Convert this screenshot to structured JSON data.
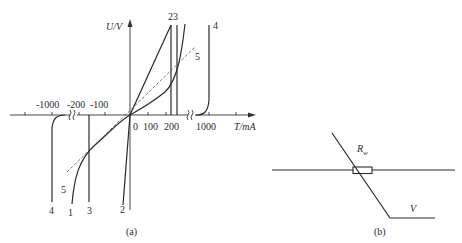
{
  "figure_a": {
    "caption": "(a)",
    "y_axis_label": "U/V",
    "x_axis_label": "T/mA",
    "origin_label": "0",
    "negative_ticks": [
      "-1000",
      "-200",
      "-100"
    ],
    "positive_ticks": [
      "100",
      "200",
      "1000"
    ],
    "curve_labels_top": {
      "c2": "2",
      "c3": "3",
      "c23": "23",
      "c4": "4",
      "c5": "5"
    },
    "curve_labels_bottom": {
      "c4": "4",
      "c1": "1",
      "c3": "3",
      "c2": "2",
      "c5": "5"
    }
  },
  "figure_b": {
    "caption": "(b)",
    "resistor_label": "R",
    "resistor_subscript": "w",
    "voltage_label": "V"
  },
  "colors": {
    "ink": "#2a2a2a",
    "dashed": "#555555",
    "background": "#ffffff"
  }
}
